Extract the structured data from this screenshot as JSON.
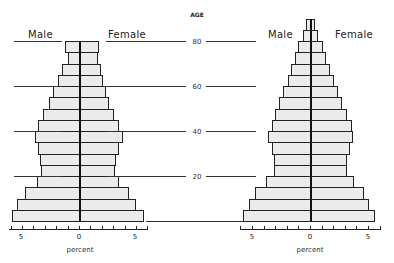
{
  "chart_data": [
    {
      "type": "bar",
      "orientation": "horizontal-pyramid",
      "title": "",
      "ylabel": "AGE",
      "xlabel": "percent",
      "age_ticks": [
        20,
        40,
        60,
        80
      ],
      "x_ticks": [
        "5",
        "0",
        "5"
      ],
      "xlim": [
        -6,
        6
      ],
      "legend": {
        "left": "Male",
        "right": "Female"
      },
      "age_groups": [
        "80+",
        "75-79",
        "70-74",
        "65-69",
        "60-64",
        "55-59",
        "50-54",
        "45-49",
        "40-44",
        "35-39",
        "30-34",
        "25-29",
        "20-24",
        "15-19",
        "10-14",
        "5-9",
        "0-4"
      ],
      "series": [
        {
          "name": "Male",
          "values": [
            null,
            1.2,
            1.0,
            1.5,
            1.8,
            2.3,
            2.6,
            3.2,
            3.6,
            3.9,
            3.6,
            3.4,
            3.3,
            3.7,
            4.7,
            5.4,
            5.9
          ]
        },
        {
          "name": "Female",
          "values": [
            null,
            1.7,
            1.6,
            1.8,
            2.0,
            2.3,
            2.5,
            3.0,
            3.4,
            3.8,
            3.4,
            3.2,
            3.1,
            3.4,
            4.3,
            4.9,
            5.6
          ]
        }
      ]
    },
    {
      "type": "bar",
      "orientation": "horizontal-pyramid",
      "title": "",
      "ylabel": "AGE",
      "xlabel": "percent",
      "age_ticks": [
        20,
        40,
        60,
        80
      ],
      "x_ticks": [
        "5",
        "0",
        "5"
      ],
      "xlim": [
        -6,
        6
      ],
      "legend": {
        "left": "Male",
        "right": "Female"
      },
      "age_groups": [
        "85+",
        "80-84",
        "75-79",
        "70-74",
        "65-69",
        "60-64",
        "55-59",
        "50-54",
        "45-49",
        "40-44",
        "35-39",
        "30-34",
        "25-29",
        "20-24",
        "15-19",
        "10-14",
        "5-9",
        "0-4"
      ],
      "series": [
        {
          "name": "Male",
          "values": [
            0.35,
            0.6,
            1.0,
            1.3,
            1.6,
            1.9,
            2.3,
            2.7,
            3.0,
            3.3,
            3.6,
            3.3,
            3.1,
            3.1,
            3.8,
            4.7,
            5.3,
            5.8
          ]
        },
        {
          "name": "Female",
          "values": [
            0.35,
            0.6,
            1.0,
            1.3,
            1.6,
            2.0,
            2.3,
            2.7,
            3.1,
            3.5,
            3.6,
            3.4,
            3.1,
            3.1,
            3.7,
            4.6,
            5.0,
            5.5
          ]
        }
      ]
    }
  ],
  "labels": {
    "age_title": "AGE",
    "male": "Male",
    "female": "Female",
    "percent": "percent",
    "age_80": "80",
    "age_60": "60",
    "age_40": "40",
    "age_20": "20",
    "tick_5": "5",
    "tick_0": "0"
  }
}
